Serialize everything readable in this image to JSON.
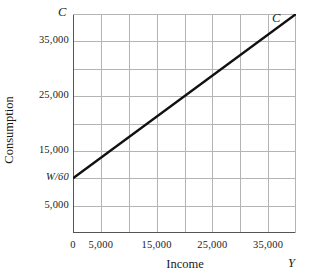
{
  "chart_data": {
    "type": "line",
    "title": "",
    "xlabel": "Income",
    "ylabel": "Consumption",
    "x_axis_name": "Y",
    "y_axis_name": "C",
    "xlim": [
      0,
      40000
    ],
    "ylim": [
      0,
      40000
    ],
    "grid": true,
    "grid_step_x": 5000,
    "grid_step_y": 5000,
    "legend": "none",
    "xticks": [
      {
        "value": 0,
        "label": "0"
      },
      {
        "value": 5000,
        "label": "5,000"
      },
      {
        "value": 15000,
        "label": "15,000"
      },
      {
        "value": 25000,
        "label": "25,000"
      },
      {
        "value": 35000,
        "label": "35,000"
      }
    ],
    "yticks": [
      {
        "value": 5000,
        "label": "5,000",
        "italic": false
      },
      {
        "value": 10000,
        "label": "W/60",
        "italic": true
      },
      {
        "value": 15000,
        "label": "15,000",
        "italic": false
      },
      {
        "value": 25000,
        "label": "25,000",
        "italic": false
      },
      {
        "value": 35000,
        "label": "35,000",
        "italic": false
      }
    ],
    "series": [
      {
        "name": "C",
        "label": "C",
        "intercept": 10000,
        "slope": 0.75,
        "points": [
          {
            "x": 0,
            "y": 10000
          },
          {
            "x": 40000,
            "y": 40000
          }
        ]
      }
    ],
    "colors": {
      "line": "#111111",
      "grid": "#b4b4b4",
      "axis": "#555555",
      "text": "#1a1a1a",
      "background": "#ffffff"
    }
  }
}
